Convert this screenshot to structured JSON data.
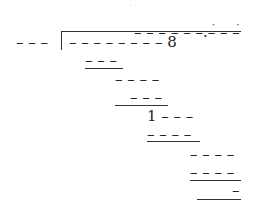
{
  "problem": {
    "type": "long-division",
    "quotient": "_ _ _ _ _ _.̇_ _ ̇_",
    "quotient_display": "– – – – – –.– – –",
    "divisor": "– – –",
    "dividend": "– – – – – – – – 8",
    "steps": [
      {
        "text": "– – –",
        "underlined": true
      },
      {
        "text": "– – – –",
        "underlined": false
      },
      {
        "text": "– – –",
        "underlined": true
      },
      {
        "text": "1 – – –",
        "underlined": false
      },
      {
        "text": "– – – –",
        "underlined": true
      },
      {
        "text": "– – – –",
        "underlined": false
      },
      {
        "text": "– – – –",
        "underlined": true
      },
      {
        "text": "–",
        "underlined": true
      }
    ]
  }
}
